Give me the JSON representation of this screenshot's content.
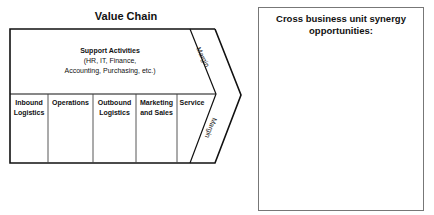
{
  "value_chain": {
    "title": "Value Chain",
    "support": {
      "heading": "Support Activities",
      "line1": "(HR, IT, Finance,",
      "line2": "Accounting, Purchasing, etc.)"
    },
    "primary_activities": [
      {
        "line1": "Inbound",
        "line2": "Logistics"
      },
      {
        "line1": "Operations",
        "line2": ""
      },
      {
        "line1": "Outbound",
        "line2": "Logistics"
      },
      {
        "line1": "Marketing",
        "line2": "and Sales"
      },
      {
        "line1": "Service",
        "line2": ""
      }
    ],
    "margin_top_label": "Margin",
    "margin_bottom_label": "Margin"
  },
  "synergy": {
    "title": "Cross business unit synergy opportunities:"
  }
}
